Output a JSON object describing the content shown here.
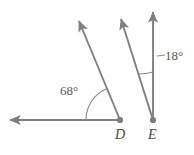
{
  "figure": {
    "kind": "geometry-angle-diagram",
    "width": 194,
    "height": 155,
    "background": "#ffffff",
    "stroke_color": "#808080",
    "arc_color": "#8a8a8a",
    "label_color": "#5a5a5a",
    "point_label_color": "#4a4a4a",
    "stroke_width": 1.9,
    "arc_width": 1.1
  },
  "points": [
    {
      "name": "D",
      "label": "D",
      "x": 120,
      "y": 120
    },
    {
      "name": "E",
      "label": "E",
      "x": 153,
      "y": 120
    }
  ],
  "rays": [
    {
      "name": "ray-D-left-horizontal",
      "from": "D",
      "x1": 120,
      "y1": 120,
      "x2": 8,
      "y2": 120,
      "arrow": "end"
    },
    {
      "name": "ray-D-upleft-slanted",
      "from": "D",
      "x1": 120,
      "y1": 120,
      "x2": 78,
      "y2": 19,
      "arrow": "end"
    },
    {
      "name": "ray-E-upleft-slanted",
      "from": "E",
      "x1": 153,
      "y1": 120,
      "x2": 120,
      "y2": 17,
      "arrow": "end"
    },
    {
      "name": "ray-E-vertical",
      "from": "E",
      "x1": 153,
      "y1": 120,
      "x2": 153,
      "y2": 10,
      "arrow": "end"
    }
  ],
  "angles": [
    {
      "name": "angle-at-D",
      "vertex": "D",
      "label": "68°",
      "value": 68,
      "unit": "degrees",
      "radius": 34,
      "between": [
        "ray-D-left-horizontal",
        "ray-D-upleft-slanted"
      ],
      "label_x": 60,
      "label_y": 84
    },
    {
      "name": "angle-at-E",
      "vertex": "E",
      "label": "18°",
      "value": 18,
      "unit": "degrees",
      "radius": 48,
      "between": [
        "ray-E-upleft-slanted",
        "ray-E-vertical"
      ],
      "label_x": 165,
      "label_y": 49,
      "leader_line": {
        "x1": 158,
        "y1": 56,
        "x2": 166,
        "y2": 56
      }
    }
  ]
}
